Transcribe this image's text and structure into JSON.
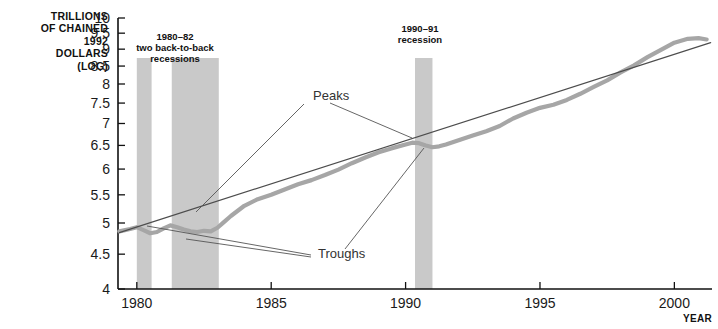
{
  "chart_data": {
    "type": "line",
    "title": "",
    "xlabel": "YEAR",
    "ylabel": "TRILLIONS OF CHAINED 1992 DOLLARS (LOG)",
    "ylabel_lines": [
      "TRILLIONS",
      "OF CHAINED",
      "1992",
      "DOLLARS",
      "(LOG)"
    ],
    "yscale": "log",
    "ylim": [
      4,
      10
    ],
    "xlim": [
      1979.3,
      2001.4
    ],
    "grid": false,
    "legend": "none",
    "yticks": [
      4,
      4.5,
      5,
      5.5,
      6,
      6.5,
      7,
      7.5,
      8,
      8.5,
      9,
      9.5,
      10
    ],
    "ytick_labels": [
      "4",
      "4.5",
      "5",
      "5.5",
      "6",
      "6.5",
      "7",
      "7.5",
      "8",
      "8.5",
      "9",
      "9.5",
      "10"
    ],
    "xticks": [
      1980,
      1985,
      1990,
      1995,
      2000
    ],
    "xtick_labels": [
      "1980",
      "1985",
      "1990",
      "1995",
      "2000"
    ],
    "series": [
      {
        "name": "Real GDP",
        "style": "thick-gray",
        "color": "#a6a6a6",
        "x": [
          1979.35,
          1979.75,
          1980.0,
          1980.25,
          1980.5,
          1980.75,
          1981.0,
          1981.25,
          1981.5,
          1981.75,
          1982.0,
          1982.25,
          1982.5,
          1982.75,
          1983.0,
          1983.25,
          1983.5,
          1984.0,
          1984.5,
          1985.0,
          1985.5,
          1986.0,
          1986.5,
          1987.0,
          1987.5,
          1988.0,
          1988.5,
          1989.0,
          1989.5,
          1990.0,
          1990.25,
          1990.5,
          1990.75,
          1991.0,
          1991.25,
          1991.5,
          1992.0,
          1992.5,
          1993.0,
          1993.5,
          1994.0,
          1994.5,
          1995.0,
          1995.5,
          1996.0,
          1996.5,
          1997.0,
          1997.5,
          1998.0,
          1998.5,
          1999.0,
          1999.5,
          2000.0,
          2000.5,
          2000.9,
          2001.2
        ],
        "y": [
          4.86,
          4.9,
          4.93,
          4.88,
          4.83,
          4.85,
          4.91,
          4.96,
          4.93,
          4.89,
          4.86,
          4.85,
          4.87,
          4.86,
          4.92,
          5.02,
          5.12,
          5.3,
          5.42,
          5.5,
          5.6,
          5.7,
          5.78,
          5.88,
          5.99,
          6.12,
          6.24,
          6.35,
          6.44,
          6.52,
          6.56,
          6.55,
          6.5,
          6.46,
          6.48,
          6.52,
          6.62,
          6.72,
          6.82,
          6.94,
          7.12,
          7.26,
          7.38,
          7.46,
          7.58,
          7.74,
          7.92,
          8.1,
          8.32,
          8.52,
          8.76,
          8.98,
          9.2,
          9.32,
          9.34,
          9.3
        ]
      },
      {
        "name": "Trend",
        "style": "thin-dark",
        "color": "#4d4d4d",
        "x": [
          1979.35,
          2001.35
        ],
        "y": [
          4.84,
          9.2
        ]
      }
    ],
    "recession_bands": [
      {
        "label": "1980 recession",
        "start": 1980.0,
        "end": 1980.55,
        "color": "#c9c9c9"
      },
      {
        "label": "1981-82 recession",
        "start": 1981.3,
        "end": 1983.05,
        "color": "#c9c9c9"
      },
      {
        "label": "1990-91 recession",
        "start": 1990.35,
        "end": 1991.0,
        "color": "#c9c9c9"
      }
    ],
    "annotations": [
      {
        "name": "recession-label-1980-82",
        "lines": [
          "1980–82",
          "two back-to-back",
          "recessions"
        ],
        "x": 175,
        "y": 40
      },
      {
        "name": "recession-label-1990-91",
        "lines": [
          "1990–91",
          "recession"
        ],
        "x": 420,
        "y": 32
      },
      {
        "name": "peaks-callout",
        "text": "Peaks",
        "x": 313,
        "y": 100
      },
      {
        "name": "troughs-callout",
        "text": "Troughs",
        "x": 318,
        "y": 258
      }
    ],
    "leader_lines": [
      {
        "from_name": "peaks-callout",
        "x1": 304,
        "y1": 104,
        "x2": 196,
        "y2": 212
      },
      {
        "from_name": "peaks-callout",
        "x1": 330,
        "y1": 103,
        "x2": 412,
        "y2": 138
      },
      {
        "from_name": "troughs-callout",
        "x1": 311,
        "y1": 255,
        "x2": 147,
        "y2": 226
      },
      {
        "from_name": "troughs-callout",
        "x1": 311,
        "y1": 257,
        "x2": 186,
        "y2": 239
      },
      {
        "from_name": "troughs-callout",
        "x1": 345,
        "y1": 249,
        "x2": 424,
        "y2": 148
      }
    ]
  },
  "axis_footer_label": "YEAR"
}
